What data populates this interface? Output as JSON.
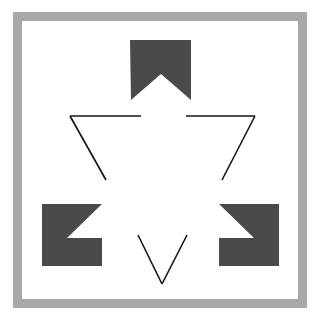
{
  "figure": {
    "canvas": {
      "width": 320,
      "height": 325,
      "background": "#ffffff"
    },
    "colors": {
      "background": "#ffffff",
      "frame": "#a8a8a8",
      "panel": "#ffffff",
      "inducer": "#4a4a4a",
      "line": "#141414"
    },
    "frame": {
      "name": "gray-border-frame",
      "x": 13,
      "y": 12,
      "width": 294,
      "height": 296,
      "stroke_width": 9
    },
    "panel": {
      "name": "white-inner-panel",
      "x": 22,
      "y": 21,
      "width": 276,
      "height": 278
    },
    "inducers": [
      {
        "name": "inducer-top",
        "label": "Top notched block",
        "points": "130,40 191,40 191,100 161,74 131,100"
      },
      {
        "name": "inducer-bottom-left",
        "label": "Bottom-left notched block",
        "points": "42,204 102,204 67,238 102,238 102,266 42,266"
      },
      {
        "name": "inducer-bottom-right",
        "label": "Bottom-right notched block",
        "points": "219,204 279,204 279,266 219,266 219,238 254,238"
      }
    ],
    "contour_lines": [
      {
        "name": "contour-line-top-left-horizontal",
        "x1": 70,
        "y1": 116,
        "x2": 141,
        "y2": 116
      },
      {
        "name": "contour-line-left-diagonal",
        "x1": 70,
        "y1": 116,
        "x2": 106,
        "y2": 180
      },
      {
        "name": "contour-line-top-right-horizontal",
        "x1": 186,
        "y1": 116,
        "x2": 255,
        "y2": 116
      },
      {
        "name": "contour-line-right-diagonal",
        "x1": 255,
        "y1": 116,
        "x2": 222,
        "y2": 180
      },
      {
        "name": "contour-line-bottom-left-diagonal",
        "x1": 138,
        "y1": 235,
        "x2": 162,
        "y2": 284
      },
      {
        "name": "contour-line-bottom-right-diagonal",
        "x1": 187,
        "y1": 235,
        "x2": 162,
        "y2": 284
      }
    ],
    "line_stroke_width": 1.6
  }
}
